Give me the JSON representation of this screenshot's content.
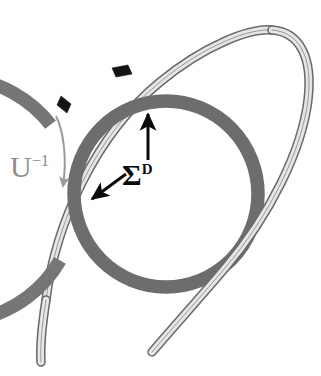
{
  "figure": {
    "background_color": "#ffffff",
    "width": 321,
    "height": 376
  },
  "labels": [
    {
      "id": "u-inverse",
      "base": "U",
      "superscript": "−1",
      "full_text": "U⁻¹",
      "color": "#8e8e8e",
      "x": 10,
      "y": 152
    },
    {
      "id": "sigma-d",
      "base": "Σ",
      "superscript": "D",
      "full_text": "Σᴰ",
      "color": "#0a0a0a",
      "x": 122,
      "y": 160
    }
  ],
  "shapes": {
    "outer_ring": {
      "name": "outer-torus-ring",
      "color": "#777777",
      "center_x": 163,
      "center_y": 185,
      "radius_x": 120,
      "radius_y": 122,
      "stroke_width": 13,
      "gap_description": "open gap on left side"
    },
    "inner_ring": {
      "name": "inner-torus-ring",
      "color": "#6e6e6e",
      "center_x": 166,
      "center_y": 194,
      "radius_x": 92,
      "radius_y": 93,
      "stroke_width": 13
    },
    "ribbon": {
      "name": "light-ribbon-loop",
      "fill_color": "#e2e2e2",
      "outline_color": "#6b6b6b",
      "band_width": 7,
      "description": "light gray band looping from lower-left up through the rings, around the right side, and back down to lower-center"
    },
    "markers": [
      {
        "name": "ring-marker-top",
        "color": "#121212",
        "x": 121,
        "y": 70,
        "shape": "parallelogram"
      },
      {
        "name": "ring-marker-upper-left",
        "color": "#121212",
        "x": 65,
        "y": 103,
        "shape": "parallelogram"
      }
    ],
    "arrows": [
      {
        "name": "sigma-vertical-arrow",
        "color": "#0a0a0a",
        "from_x": 148,
        "from_y": 158,
        "to_x": 148,
        "to_y": 111,
        "direction": "up",
        "points_to": "inner-torus-ring"
      },
      {
        "name": "sigma-diagonal-arrow",
        "color": "#0a0a0a",
        "from_x": 124,
        "from_y": 175,
        "to_x": 90,
        "to_y": 200,
        "direction": "down-left",
        "points_to": "light-ribbon-loop"
      },
      {
        "name": "u-inverse-curved-arrow",
        "color": "#9a9a9a",
        "direction": "clockwise-downward",
        "points_to": "outer-torus-ring-gap"
      }
    ]
  }
}
